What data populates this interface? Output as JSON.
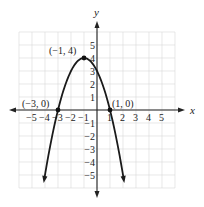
{
  "chart_data": {
    "type": "line",
    "title": "",
    "function": "y = -(x+1)^2 + 4",
    "xlabel": "x",
    "ylabel": "y",
    "xlim": [
      -6,
      6
    ],
    "ylim": [
      -6,
      6
    ],
    "grid": true,
    "x_ticks": [
      "-5",
      "-4",
      "-3",
      "-2",
      "-1",
      "1",
      "2",
      "3",
      "4",
      "5"
    ],
    "y_ticks": [
      "5",
      "4",
      "3",
      "2",
      "1",
      "-1",
      "-2",
      "-3",
      "-4",
      "-5"
    ],
    "series": [
      {
        "name": "parabola",
        "x": [
          -4.1,
          -4,
          -3.5,
          -3,
          -2.5,
          -2,
          -1.5,
          -1,
          -0.5,
          0,
          0.5,
          1,
          1.5,
          2,
          2.1
        ],
        "y": [
          -5.61,
          -5,
          -2.25,
          0,
          1.75,
          3,
          3.75,
          4,
          3.75,
          3,
          1.75,
          0,
          -2.25,
          -5,
          -5.61
        ]
      }
    ],
    "annotations": [
      {
        "label": "(−1, 4)",
        "x": -1,
        "y": 4,
        "type": "vertex"
      },
      {
        "label": "(−3, 0)",
        "x": -3,
        "y": 0,
        "type": "x-intercept"
      },
      {
        "label": "(1, 0)",
        "x": 1,
        "y": 0,
        "type": "x-intercept"
      }
    ]
  },
  "labels": {
    "x_axis": "x",
    "y_axis": "y",
    "vertex": "(−1, 4)",
    "left_intercept": "(−3, 0)",
    "right_intercept": "(1, 0)",
    "xt": [
      "−5",
      "−4",
      "−3",
      "−2",
      "−1",
      "1",
      "2",
      "3",
      "4",
      "5"
    ],
    "yt": [
      "5",
      "4",
      "3",
      "2",
      "1",
      "−1",
      "−2",
      "−3",
      "−4",
      "−5"
    ]
  }
}
